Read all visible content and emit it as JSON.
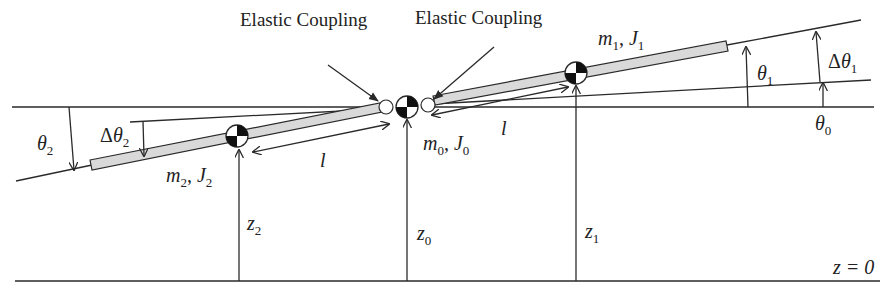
{
  "labels": {
    "coupling_left": "Elastic Coupling",
    "coupling_right": "Elastic Coupling",
    "body1": {
      "m": "m",
      "m_sub": "1",
      "sep": ", ",
      "J": "J",
      "J_sub": "1"
    },
    "body0": {
      "m": "m",
      "m_sub": "0",
      "sep": ", ",
      "J": "J",
      "J_sub": "0"
    },
    "body2": {
      "m": "m",
      "m_sub": "2",
      "sep": ", ",
      "J": "J",
      "J_sub": "2"
    },
    "length_right": "l",
    "length_left": "l",
    "theta1": {
      "sym": "θ",
      "sub": "1"
    },
    "dtheta1": {
      "sym": "Δθ",
      "sub": "1"
    },
    "theta0": {
      "sym": "θ",
      "sub": "0"
    },
    "theta2": {
      "sym": "θ",
      "sub": "2"
    },
    "dtheta2": {
      "sym": "Δθ",
      "sub": "2"
    },
    "z2": {
      "sym": "z",
      "sub": "2"
    },
    "z0": {
      "sym": "z",
      "sub": "0"
    },
    "z1": {
      "sym": "z",
      "sub": "1"
    },
    "ground": "z = 0"
  },
  "colors": {
    "line": "#2a2a2a",
    "bar_fill": "#d9d9d9",
    "background": "#ffffff"
  }
}
